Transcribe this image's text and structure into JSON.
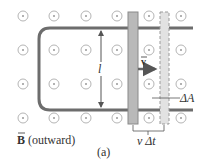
{
  "diagram": {
    "caption": "(a)",
    "field_label_symbol": "B",
    "field_label_text": "(outward)",
    "length_label": "l",
    "velocity_label": "v",
    "area_label": "ΔA",
    "displacement_label": "v Δt",
    "colors": {
      "rail": "#6d6d6d",
      "dot_circle": "#b5b5b5",
      "bar_solid": "#b9b9b9",
      "bar_solid_edge": "#8a8a8a",
      "bar_dashed": "#e2e2e2",
      "bar_dashed_edge": "#9a9a9a",
      "arrow": "#666666",
      "text": "#333333"
    },
    "field_dots": {
      "columns_x": [
        23,
        54,
        86,
        117,
        149,
        181
      ],
      "rows_y": [
        16,
        50,
        84,
        118
      ]
    }
  }
}
